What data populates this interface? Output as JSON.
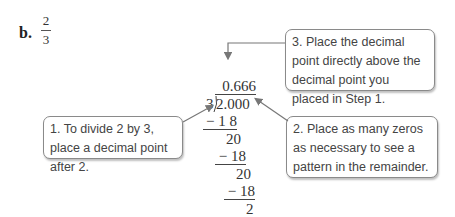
{
  "problem": {
    "label": "b.",
    "fraction": {
      "numerator": "2",
      "denominator": "3"
    }
  },
  "division": {
    "quotient": "0.666",
    "divisor": "3",
    "dividend": "2.000",
    "steps": [
      {
        "subtract": "− 1 8",
        "remainder": "20"
      },
      {
        "subtract": "− 18",
        "remainder": "20"
      },
      {
        "subtract": "− 18",
        "remainder": "2"
      }
    ]
  },
  "callouts": [
    {
      "id": "step1",
      "text": "1.  To divide 2 by 3, place a decimal point after 2."
    },
    {
      "id": "step2",
      "text": "2.  Place as many zeros as necessary to see a pattern in the remainder."
    },
    {
      "id": "step3",
      "text": "3.  Place the decimal point directly above the decimal point you placed in Step 1."
    }
  ],
  "colors": {
    "callout_border": "#8a8a8a",
    "arrow": "#777777",
    "text": "#333333"
  }
}
